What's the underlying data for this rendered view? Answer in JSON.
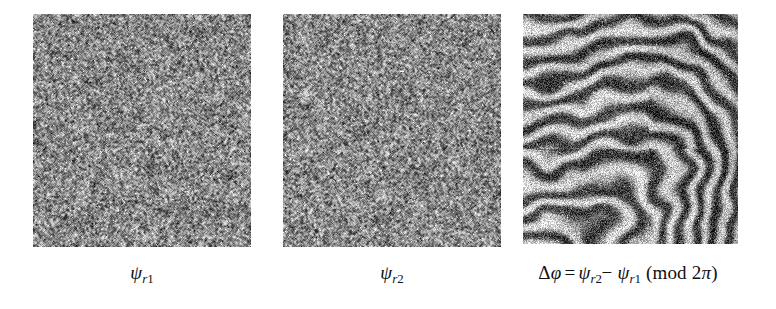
{
  "figure": {
    "background_color": "#ffffff",
    "panel_count": 3
  },
  "panels": [
    {
      "id": "psi-r1",
      "kind": "speckle-noise",
      "alt": "random speckle phase map",
      "mean_gray": "#555555",
      "caption": {
        "symbol": "ψ",
        "subscript_italic": "r",
        "subscript_upright": "1",
        "plain": "ψr1"
      }
    },
    {
      "id": "psi-r2",
      "kind": "speckle-noise",
      "alt": "random speckle phase map",
      "mean_gray": "#555555",
      "caption": {
        "symbol": "ψ",
        "subscript_italic": "r",
        "subscript_upright": "2",
        "plain": "ψr2"
      }
    },
    {
      "id": "delta-phi",
      "kind": "fringe-interferogram",
      "alt": "wrapped phase difference showing concentric fingerprint-like fringes",
      "mean_gray": "#5a5a5a",
      "caption": {
        "delta": "Δ",
        "phi": "φ",
        "equals": "=",
        "term1_symbol": "ψ",
        "term1_sub_italic": "r",
        "term1_sub_upright": "2",
        "minus": "−",
        "term2_symbol": "ψ",
        "term2_sub_italic": "r",
        "term2_sub_upright": "1",
        "mod_open": "(",
        "mod_text": "mod",
        "mod_factor": "2",
        "mod_pi": "π",
        "mod_close": ")",
        "plain": "Δφ = ψr2 − ψr1 (mod 2π)"
      }
    }
  ]
}
